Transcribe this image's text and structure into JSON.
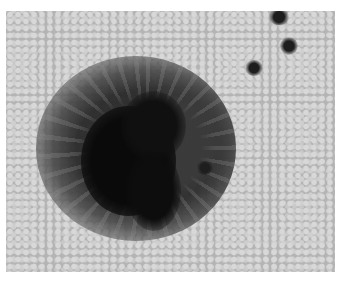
{
  "image": {
    "subject": "sunspot",
    "description": "Grayscale solar photograph showing a dark sunspot (umbra with filamentary penumbra) surrounded by granulation, with a few small dark pores at upper right",
    "colors": {
      "background": "#ffffff",
      "granulation": "#b4b4b4",
      "granule_bright": "#d8d8d8",
      "penumbra": "#464646",
      "umbra": "#0a0a0a"
    },
    "features": [
      {
        "name": "umbra",
        "approx_center": [
          130,
          150
        ]
      },
      {
        "name": "penumbra",
        "approx_center": [
          130,
          148
        ]
      },
      {
        "name": "pore",
        "approx_center": [
          276,
          14
        ]
      },
      {
        "name": "pore",
        "approx_center": [
          287,
          42
        ]
      },
      {
        "name": "pore",
        "approx_center": [
          253,
          65
        ]
      }
    ]
  }
}
